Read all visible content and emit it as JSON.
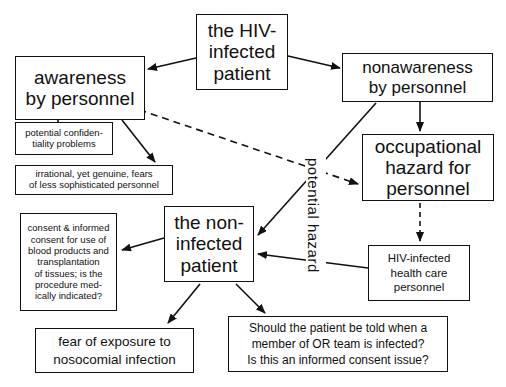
{
  "nodes": {
    "hiv_patient": "the HIV-\ninfected\npatient",
    "awareness": "awareness\nby personnel",
    "nonawareness": "nonawareness\nby personnel",
    "confidentiality": "potential confiden-\ntiality problems",
    "irrational_fears": "irrational, yet genuine, fears\nof less sophisticated personnel",
    "occupational_hazard": "occupational\nhazard for\npersonnel",
    "noninfected_patient": "the non-\ninfected\npatient",
    "consent": "consent & informed\nconsent for use of\nblood products and\ntransplantation\nof tissues; is the\nprocedure med-\nically indicated?",
    "hiv_hcp": "HIV-infected\nhealth care\npersonnel",
    "fear_exposure": "fear of exposure to\nnosocomial infection",
    "should_told": "Should the patient be told when a\nmember of  OR  team is infected?\nIs this an informed consent issue?"
  },
  "edge_labels": {
    "potential_hazard": "potential hazard"
  },
  "colors": {
    "stroke": "#111111",
    "background": "#ffffff"
  }
}
